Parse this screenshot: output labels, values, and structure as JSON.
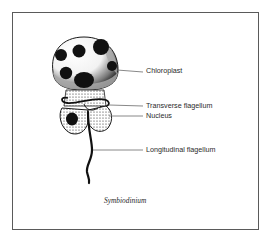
{
  "figure": {
    "title": "Symbiodinium",
    "labels": [
      {
        "id": "chloroplast",
        "text": "Chloroplast"
      },
      {
        "id": "transverse-flagellum",
        "text": "Transverse flagellum"
      },
      {
        "id": "nucleus",
        "text": "Nucleus"
      },
      {
        "id": "longitudinal-flagellum",
        "text": "Longitudinal flagellum"
      }
    ]
  },
  "colors": {
    "frame": "#5a5a5a",
    "ink": "#1a1a1a",
    "leader_line": "#6a6a6a",
    "background": "#ffffff"
  }
}
